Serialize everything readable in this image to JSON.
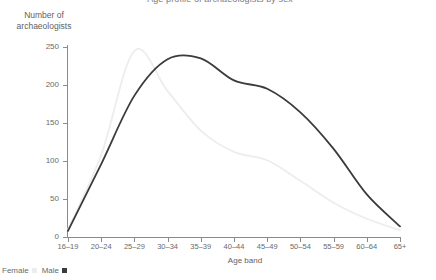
{
  "chart_data": {
    "type": "line",
    "title": "Age profile of archaeologists by sex",
    "xlabel": "Age band",
    "ylabel": "Number of archaeologists",
    "categories": [
      "16–19",
      "20–24",
      "25–29",
      "30–34",
      "35–39",
      "40–44",
      "45–49",
      "50–54",
      "55–59",
      "60–64",
      "65+"
    ],
    "ylim": [
      0,
      250
    ],
    "yticks": [
      0,
      50,
      100,
      150,
      200,
      250
    ],
    "ytick_labels": [
      "0",
      "50",
      "100",
      "150",
      "200",
      "250"
    ],
    "grid": false,
    "legend_position": "bottom-left",
    "series": [
      {
        "name": "Female",
        "color": "#ededed",
        "values": [
          10,
          108,
          245,
          192,
          140,
          112,
          101,
          74,
          45,
          24,
          9
        ]
      },
      {
        "name": "Male",
        "color": "#3b3b3b",
        "values": [
          8,
          96,
          186,
          234,
          235,
          206,
          195,
          164,
          116,
          56,
          14
        ]
      }
    ]
  },
  "legend": {
    "female_label": "Female",
    "male_label": "Male"
  },
  "colors": {
    "female": "#ededed",
    "male": "#3b3b3b",
    "axis": "#8a8a8a",
    "text": "#6a6a6a",
    "background": "#ffffff"
  }
}
